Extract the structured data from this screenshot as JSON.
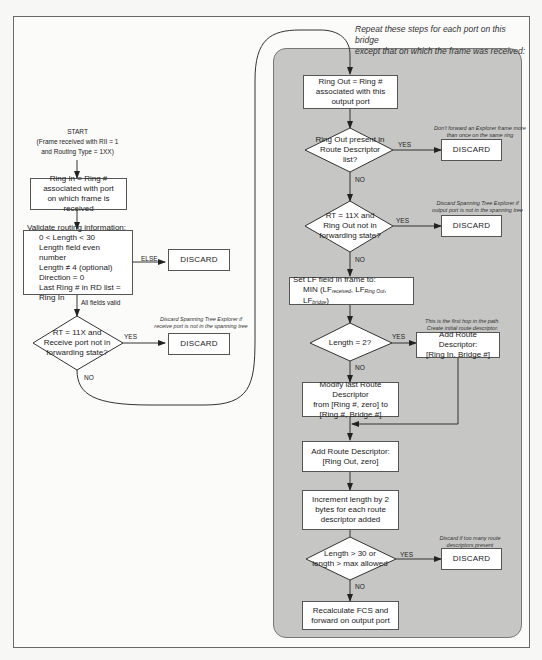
{
  "diagram": {
    "type": "flowchart",
    "start": {
      "label": "START",
      "line1": "(Frame received with RII = 1",
      "line2": "and Routing Type = 1XX)"
    },
    "left_flow": {
      "ring_in_box": [
        "Ring In = Ring #",
        "associated with port",
        "on which frame is received"
      ],
      "validate_box": {
        "title": "Validate routing information:",
        "items": [
          "0 < Length < 30",
          "Length field even number",
          "Length ≠ 4 (optional)",
          "Direction = 0",
          "Last Ring # in RD list = Ring In"
        ]
      },
      "else_label": "ELSE",
      "all_valid_label": "All fields valid",
      "decision_rt_receive": [
        "RT = 11X and",
        "Receive port not in",
        "forwarding state?"
      ],
      "yes_label": "YES",
      "no_label": "NO",
      "note_spanning_receive": [
        "Discard Spanning Tree Explorer if",
        "receive port is not in the spanning tree"
      ],
      "discard_label": "DISCARD"
    },
    "repeat_note": [
      "Repeat these steps for each port on this bridge",
      "except that on which the frame was received:"
    ],
    "right_flow": {
      "ring_out_box": [
        "Ring Out = Ring #",
        "associated with this",
        "output port"
      ],
      "decision_ring_out_present": [
        "Ring Out present in",
        "Route Descriptor",
        "list?"
      ],
      "note_explorer": [
        "Don't forward an Explorer frame more",
        "than once on the same ring"
      ],
      "decision_rt_ring_out": [
        "RT = 11X and",
        "Ring Out not in",
        "forwarding state?"
      ],
      "note_spanning_output": [
        "Discard Spanning Tree Explorer if",
        "output port is not in the spanning tree"
      ],
      "set_lf_box": {
        "line1": "Set LF field in frame to:",
        "line2_prefix": "MIN (LF",
        "sub1": "received",
        "sep1": ", LF",
        "sub2": "Ring Out",
        "sep2": ", LF",
        "sub3": "bridge",
        "suffix": ")"
      },
      "decision_length2": "Length = 2?",
      "note_first_hop": [
        "This is the first hop in the path.",
        "Create initial route descriptor."
      ],
      "add_rd_initial_box": [
        "Add Route Descriptor:",
        "[Ring In, Bridge #]"
      ],
      "modify_rd_box": [
        "Modify last Route Descriptor",
        "from [Ring #, zero] to",
        "[Ring #, Bridge #]"
      ],
      "add_rd_box": [
        "Add Route Descriptor:",
        "[Ring Out, zero]"
      ],
      "increment_box": [
        "Increment length by 2",
        "bytes for each route",
        "descriptor added"
      ],
      "decision_length_max": [
        "Length > 30 or",
        "length > max allowed"
      ],
      "note_too_many": [
        "Discard if too many route",
        "descriptors present"
      ],
      "recalc_box": [
        "Recalculate FCS and",
        "forward on output port"
      ],
      "yes_label": "YES",
      "no_label": "NO",
      "discard_label": "DISCARD"
    },
    "colors": {
      "panel_fill": "#c6c6c4",
      "box_fill": "#ffffff",
      "line": "#333333",
      "background": "#fbfbfa"
    }
  }
}
